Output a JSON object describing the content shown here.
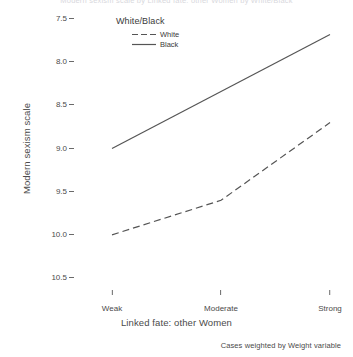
{
  "title_clipped": "Modern sexism scale by Linked fate: other Women by White/Black",
  "footnote": "Cases weighted by Weight variable",
  "legend": {
    "title": "White/Black",
    "entries": [
      {
        "label": "White",
        "style": "dashed",
        "color": "#555555"
      },
      {
        "label": "Black",
        "style": "solid",
        "color": "#555555"
      }
    ]
  },
  "axes": {
    "y_title": "Modern sexism scale",
    "x_title": "Linked fate: other Women",
    "y_ticks": [
      "10.5",
      "10.0",
      "9.5",
      "9.0",
      "8.5",
      "8.0",
      "7.5"
    ],
    "x_ticks": [
      "Weak",
      "Moderate",
      "Strong"
    ]
  },
  "chart_data": {
    "type": "line",
    "title": "Modern sexism scale by Linked fate: other Women by White/Black",
    "xlabel": "Linked fate: other Women",
    "ylabel": "Modern sexism scale",
    "categories": [
      "Weak",
      "Moderate",
      "Strong"
    ],
    "series": [
      {
        "name": "White",
        "style": "dashed",
        "color": "#555555",
        "values": [
          8.0,
          8.4,
          9.3
        ]
      },
      {
        "name": "Black",
        "style": "solid",
        "color": "#555555",
        "values": [
          9.0,
          9.66,
          10.32
        ]
      }
    ],
    "ylim": [
      7.5,
      10.5
    ],
    "y_ticks": [
      7.5,
      8.0,
      8.5,
      9.0,
      9.5,
      10.0,
      10.5
    ],
    "grid": false,
    "legend_position": "top-center",
    "legend_title": "White/Black",
    "footnote": "Cases weighted by Weight variable"
  }
}
